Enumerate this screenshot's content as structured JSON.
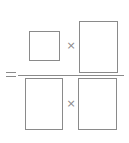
{
  "equation": {
    "equals_symbol": "=",
    "numerator": {
      "left_box": {
        "label": "",
        "type": "blank-square"
      },
      "operator": "×",
      "right_box": {
        "label": "",
        "type": "blank-rectangle"
      }
    },
    "denominator": {
      "left_box": {
        "label": "",
        "type": "blank-rectangle"
      },
      "operator": "×",
      "right_box": {
        "label": "",
        "type": "blank-rectangle"
      }
    }
  },
  "colors": {
    "stroke": "#8a8a8a",
    "background": "#ffffff"
  }
}
